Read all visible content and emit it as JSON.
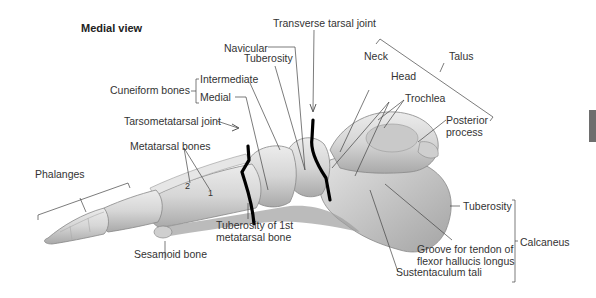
{
  "figure": {
    "view_title": "Medial view",
    "side_tab_color": "#6e6e6e",
    "bone_fill": "#d9d9d9",
    "bone_shade": "#b8b8b8",
    "joint_line_color": "#000000",
    "leader_color": "#444444"
  },
  "labels": {
    "transverse_tarsal_joint": "Transverse tarsal joint",
    "navicular": "Navicular",
    "tuberosity_navicular": "Tuberosity",
    "cuneiform_bones": "Cuneiform bones",
    "intermediate": "Intermediate",
    "medial": "Medial",
    "tarsometatarsal_joint": "Tarsometatarsal joint",
    "metatarsal_bones": "Metatarsal bones",
    "metatarsal_num_2": "2",
    "metatarsal_num_1": "1",
    "phalanges": "Phalanges",
    "sesamoid_bone": "Sesamoid bone",
    "tuberosity_1st_metatarsal_line1": "Tuberosity of 1st",
    "tuberosity_1st_metatarsal_line2": "metatarsal bone",
    "neck": "Neck",
    "head": "Head",
    "talus": "Talus",
    "trochlea": "Trochlea",
    "posterior_process_line1": "Posterior",
    "posterior_process_line2": "process",
    "tuberosity_calcaneus": "Tuberosity",
    "calcaneus": "Calcaneus",
    "groove_line1": "Groove for tendon of",
    "groove_line2": "flexor hallucis longus",
    "sustentaculum_tali": "Sustentaculum tali"
  }
}
